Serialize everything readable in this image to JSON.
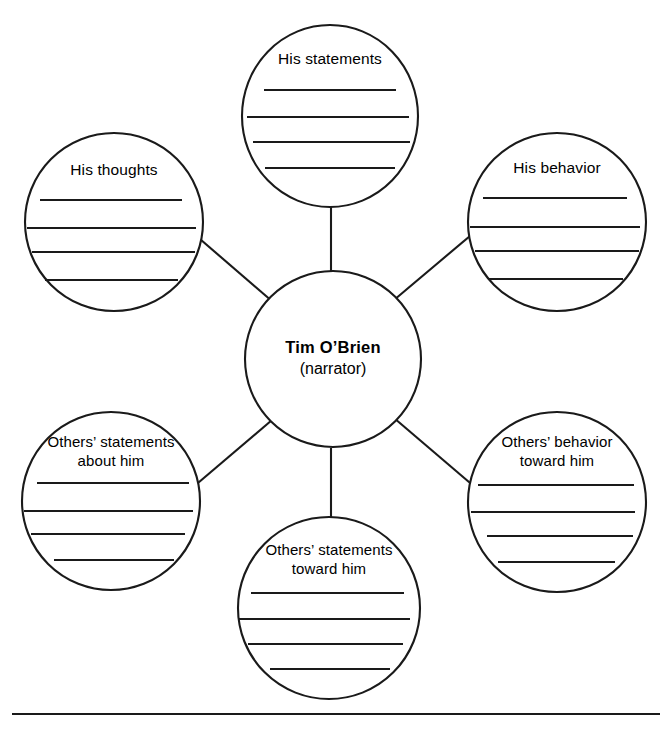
{
  "organizer": {
    "type": "character-web",
    "center": {
      "name": "Tim O’Brien",
      "role": "(narrator)",
      "cx": 333,
      "cy": 359,
      "r": 88
    },
    "nodes": [
      {
        "id": "his-statements",
        "label_line1": "His statements",
        "label_line2": "",
        "cx": 330,
        "cy": 116,
        "rx": 88,
        "ry": 91,
        "label_y": 60,
        "lines": [
          {
            "y": 90,
            "x1": 264,
            "x2": 396
          },
          {
            "y": 117,
            "x1": 247,
            "x2": 409
          },
          {
            "y": 142,
            "x1": 253,
            "x2": 410
          },
          {
            "y": 168,
            "x1": 265,
            "x2": 395
          }
        ]
      },
      {
        "id": "his-thoughts",
        "label_line1": "His thoughts",
        "label_line2": "",
        "cx": 114,
        "cy": 222,
        "rx": 89,
        "ry": 89,
        "label_y": 171,
        "lines": [
          {
            "y": 200,
            "x1": 40,
            "x2": 182
          },
          {
            "y": 228,
            "x1": 27,
            "x2": 196
          },
          {
            "y": 252,
            "x1": 32,
            "x2": 195
          },
          {
            "y": 280,
            "x1": 45,
            "x2": 178
          }
        ]
      },
      {
        "id": "his-behavior",
        "label_line1": "His behavior",
        "label_line2": "",
        "cx": 557,
        "cy": 222,
        "rx": 89,
        "ry": 89,
        "label_y": 169,
        "lines": [
          {
            "y": 198,
            "x1": 483,
            "x2": 627
          },
          {
            "y": 227,
            "x1": 470,
            "x2": 640
          },
          {
            "y": 251,
            "x1": 475,
            "x2": 639
          },
          {
            "y": 279,
            "x1": 488,
            "x2": 623
          }
        ]
      },
      {
        "id": "others-statements-about-him",
        "label_line1": "Others’ statements",
        "label_line2": "about him",
        "cx": 111,
        "cy": 501,
        "rx": 89,
        "ry": 89,
        "label_y": 443,
        "lines": [
          {
            "y": 483,
            "x1": 37,
            "x2": 189
          },
          {
            "y": 511,
            "x1": 24,
            "x2": 193
          },
          {
            "y": 534,
            "x1": 31,
            "x2": 185
          },
          {
            "y": 560,
            "x1": 54,
            "x2": 174
          }
        ]
      },
      {
        "id": "others-behavior-toward-him",
        "label_line1": "Others’ behavior",
        "label_line2": "toward him",
        "cx": 557,
        "cy": 502,
        "rx": 89,
        "ry": 90,
        "label_y": 443,
        "lines": [
          {
            "y": 485,
            "x1": 478,
            "x2": 634
          },
          {
            "y": 512,
            "x1": 471,
            "x2": 635
          },
          {
            "y": 536,
            "x1": 487,
            "x2": 633
          },
          {
            "y": 562,
            "x1": 498,
            "x2": 615
          }
        ]
      },
      {
        "id": "others-statements-toward-him",
        "label_line1": "Others’ statements",
        "label_line2": "toward him",
        "cx": 329,
        "cy": 608,
        "rx": 91,
        "ry": 91,
        "label_y": 551,
        "lines": [
          {
            "y": 593,
            "x1": 251,
            "x2": 404
          },
          {
            "y": 619,
            "x1": 239,
            "x2": 410
          },
          {
            "y": 644,
            "x1": 248,
            "x2": 403
          },
          {
            "y": 669,
            "x1": 270,
            "x2": 390
          }
        ]
      }
    ],
    "connectors": [
      {
        "id": "center-to-his-statements",
        "x1": 331,
        "y1": 271,
        "x2": 331,
        "y2": 207
      },
      {
        "id": "center-to-his-thoughts",
        "x1": 273,
        "y1": 302,
        "x2": 186,
        "y2": 227
      },
      {
        "id": "center-to-his-behavior",
        "x1": 394,
        "y1": 300,
        "x2": 483,
        "y2": 225
      },
      {
        "id": "center-to-others-statements-about",
        "x1": 272,
        "y1": 420,
        "x2": 185,
        "y2": 494
      },
      {
        "id": "center-to-others-behavior-toward",
        "x1": 394,
        "y1": 418,
        "x2": 483,
        "y2": 494
      },
      {
        "id": "center-to-others-statements-toward",
        "x1": 331,
        "y1": 448,
        "x2": 331,
        "y2": 517
      }
    ],
    "footer_rule": {
      "x1": 12,
      "y": 714,
      "x2": 660
    }
  },
  "colors": {
    "stroke": "#1a1a1a",
    "background": "#ffffff",
    "text": "#000000"
  }
}
